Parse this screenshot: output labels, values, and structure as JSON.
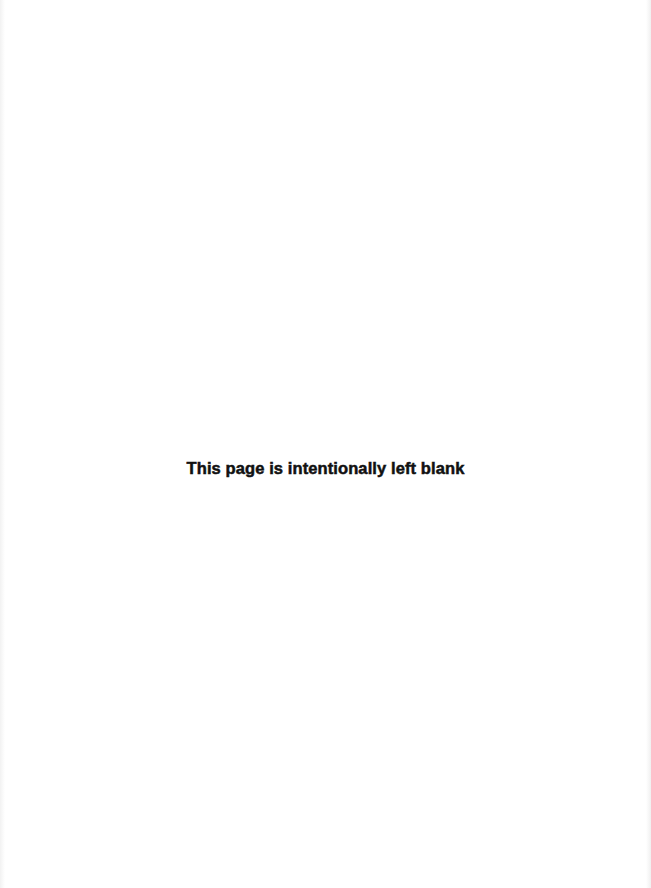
{
  "page": {
    "background_color": "#ffffff",
    "notice_text": "This page is intentionally left blank",
    "notice_color": "#111111"
  }
}
